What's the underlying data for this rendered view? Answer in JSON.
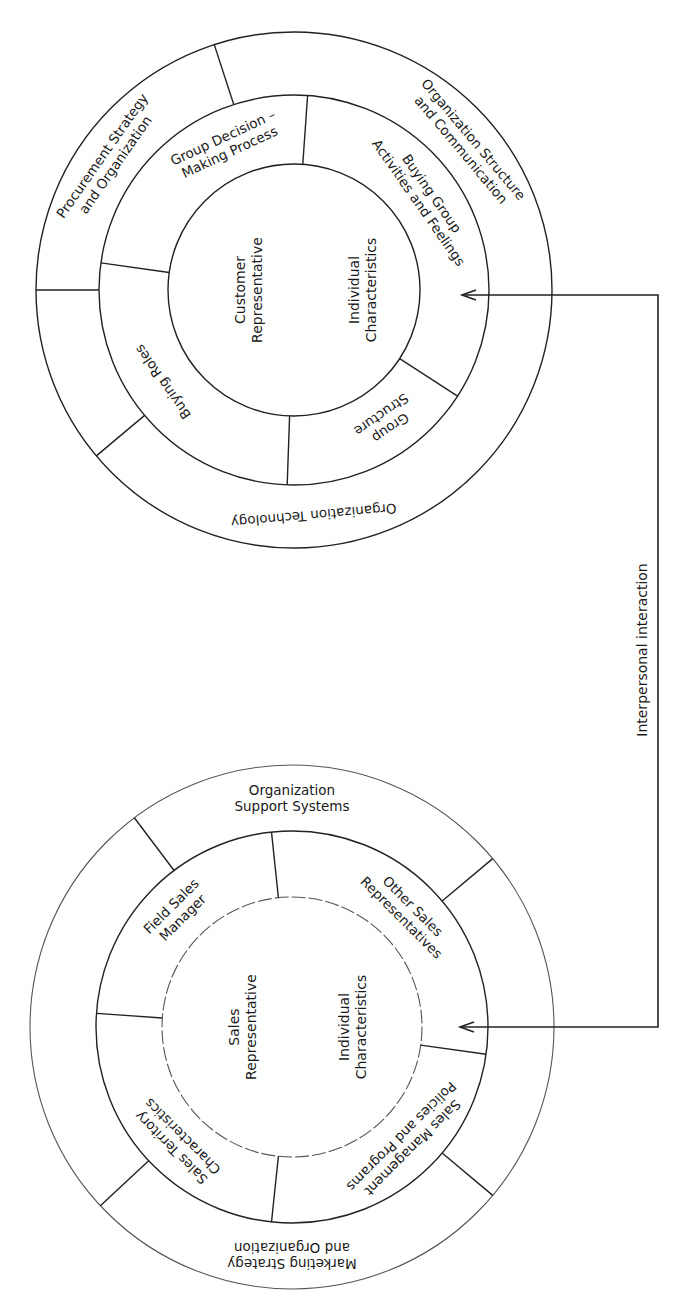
{
  "diagram": {
    "connector": {
      "label": "Interpersonal interaction",
      "line_x": 658,
      "top_y": 295,
      "bottom_y": 1027,
      "top_arrow_tip_x": 462,
      "bottom_arrow_tip_x": 460
    },
    "customer_circle": {
      "center": [
        294,
        290
      ],
      "radii": {
        "outer": 258,
        "middle": 195,
        "inner": 126
      },
      "core_labels": [
        {
          "lines": [
            "Customer",
            "Representative"
          ],
          "x": 248,
          "y": 290
        },
        {
          "lines": [
            "Individual",
            "Characteristics"
          ],
          "x": 362,
          "y": 290
        }
      ],
      "middle_ring": [
        {
          "label": [
            "Group Decision –",
            "Making Process"
          ],
          "angle": -115
        },
        {
          "label": [
            "Buying Group",
            "Activities and Feelings"
          ],
          "angle": -35
        },
        {
          "label": [
            "Group",
            "Structure"
          ],
          "angle": 55
        },
        {
          "label": [
            "Buying Roles"
          ],
          "angle": 145
        }
      ],
      "middle_dividers": [
        -86,
        33,
        92,
        188
      ],
      "outer_ring": [
        {
          "label": [
            "Procurement Strategy",
            "and Organization"
          ],
          "angle": -145
        },
        {
          "label": [
            "Organization Structure",
            "and Communication"
          ],
          "angle": -40
        },
        {
          "label": [
            "Organization Technology"
          ],
          "angle": 85
        }
      ],
      "outer_dividers": [
        -108,
        140,
        180
      ]
    },
    "sales_circle": {
      "center": [
        292,
        1027
      ],
      "radii": {
        "outer": 262,
        "middle": 196,
        "inner": 130
      },
      "core_labels": [
        {
          "lines": [
            "Sales",
            "Representative"
          ],
          "x": 242,
          "y": 1027
        },
        {
          "lines": [
            "Individual",
            "Characteristics"
          ],
          "x": 352,
          "y": 1027
        }
      ],
      "middle_ring": [
        {
          "label": [
            "Field Sales",
            "Manager"
          ],
          "angle": -135
        },
        {
          "label": [
            "Other Sales",
            "Representatives"
          ],
          "angle": -45
        },
        {
          "label": [
            "Sales Management",
            "Policies and Programs"
          ],
          "angle": 45
        },
        {
          "label": [
            "Sales Territory",
            "Characteristics"
          ],
          "angle": 135
        }
      ],
      "middle_dividers": [
        -96,
        8,
        96,
        184
      ],
      "outer_ring": [
        {
          "label": [
            "Organization",
            "Support Systems"
          ],
          "angle": -90
        },
        {
          "label": [
            "Marketing Strategy",
            "and Organization"
          ],
          "angle": 90
        }
      ],
      "outer_dividers": [
        -127,
        -40,
        40,
        137
      ]
    }
  }
}
